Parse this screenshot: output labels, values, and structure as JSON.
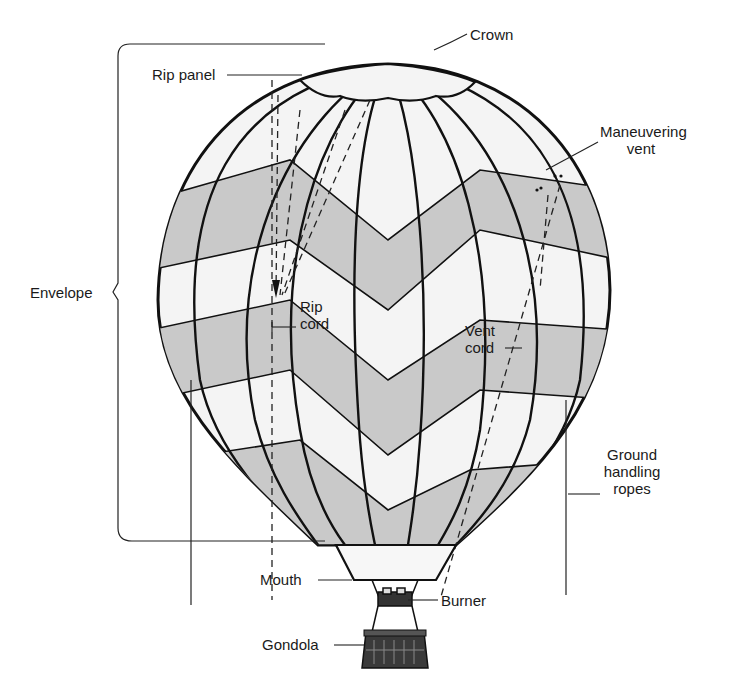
{
  "diagram": {
    "colors": {
      "outline": "#111111",
      "panel_light": "#f4f4f4",
      "panel_shaded": "#c9c9c9",
      "background": "#ffffff"
    },
    "labels": {
      "crown": "Crown",
      "rip_panel": "Rip panel",
      "maneuvering_vent_line1": "Maneuvering",
      "maneuvering_vent_line2": "vent",
      "envelope": "Envelope",
      "rip_cord_line1": "Rip",
      "rip_cord_line2": "cord",
      "vent_cord_line1": "Vent",
      "vent_cord_line2": "cord",
      "ground_handling_ropes_line1": "Ground",
      "ground_handling_ropes_line2": "handling",
      "ground_handling_ropes_line3": "ropes",
      "mouth": "Mouth",
      "burner": "Burner",
      "gondola": "Gondola"
    }
  }
}
